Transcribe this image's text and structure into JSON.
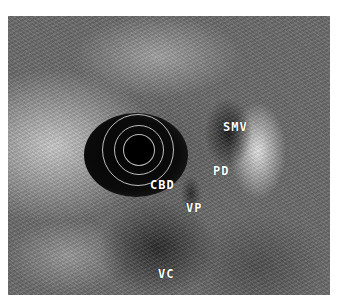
{
  "image": {
    "description": "Endoscopic ultrasound (radial) image of pancreatic head region with annotated anatomical structures",
    "labels": [
      {
        "id": "smv",
        "text": "SMV",
        "x": 223,
        "y": 120
      },
      {
        "id": "pd",
        "text": "PD",
        "x": 213,
        "y": 164
      },
      {
        "id": "cbd",
        "text": "CBD",
        "x": 150,
        "y": 178
      },
      {
        "id": "vp",
        "text": "VP",
        "x": 186,
        "y": 201
      },
      {
        "id": "vc",
        "text": "VC",
        "x": 158,
        "y": 267
      }
    ]
  }
}
